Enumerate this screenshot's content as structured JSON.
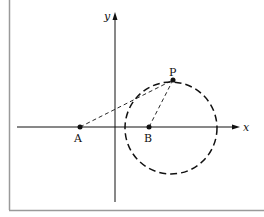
{
  "figure": {
    "frame_color": "#9a9a9a",
    "ink_color": "#111111",
    "axes": {
      "x_label": "x",
      "y_label": "y"
    },
    "points": {
      "A": {
        "label": "A"
      },
      "B": {
        "label": "B"
      },
      "P": {
        "label": "P"
      }
    },
    "circle": {
      "center": "B-ish",
      "style": "dashed"
    },
    "segments": [
      {
        "from": "A",
        "to": "P",
        "style": "dashed"
      },
      {
        "from": "B",
        "to": "P",
        "style": "dashed"
      }
    ]
  }
}
